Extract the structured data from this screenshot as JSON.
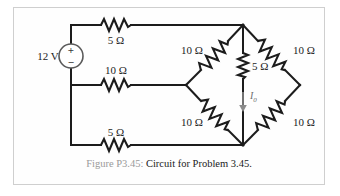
{
  "figure": {
    "caption_figure_number": "Figure P3.45:",
    "caption_text": "Circuit for Problem 3.45.",
    "border_color": "#cfcfcf",
    "wire_color": "#1c1c1c"
  },
  "source": {
    "name": "independent-voltage-source",
    "value_label": "12 V",
    "plus_sign": "+",
    "minus_sign": "−",
    "symbol": "circle-with-plus-minus"
  },
  "current": {
    "label": "I",
    "subscript": "0",
    "direction": "down",
    "color": "#8a8a8a"
  },
  "resistors": [
    {
      "id": "R-top-left",
      "label": "5 Ω",
      "value": 5,
      "unit": "Ω",
      "orientation": "horizontal",
      "label_position": "below"
    },
    {
      "id": "R-middle-left",
      "label": "10 Ω",
      "value": 10,
      "unit": "Ω",
      "orientation": "horizontal",
      "label_position": "above"
    },
    {
      "id": "R-bottom-left",
      "label": "5 Ω",
      "value": 5,
      "unit": "Ω",
      "orientation": "horizontal",
      "label_position": "above"
    },
    {
      "id": "R-bridge-upper-left",
      "label": "10 Ω",
      "value": 10,
      "unit": "Ω",
      "orientation": "diagonal-up-right",
      "label_position": "left"
    },
    {
      "id": "R-bridge-lower-left",
      "label": "10 Ω",
      "value": 10,
      "unit": "Ω",
      "orientation": "diagonal-down-right",
      "label_position": "left"
    },
    {
      "id": "R-bridge-center",
      "label": "5 Ω",
      "value": 5,
      "unit": "Ω",
      "orientation": "vertical",
      "label_position": "right"
    },
    {
      "id": "R-bridge-upper-right",
      "label": "10 Ω",
      "value": 10,
      "unit": "Ω",
      "orientation": "diagonal-down-right",
      "label_position": "right"
    },
    {
      "id": "R-bridge-lower-right",
      "label": "10 Ω",
      "value": 10,
      "unit": "Ω",
      "orientation": "diagonal-up-right",
      "label_position": "right"
    }
  ]
}
